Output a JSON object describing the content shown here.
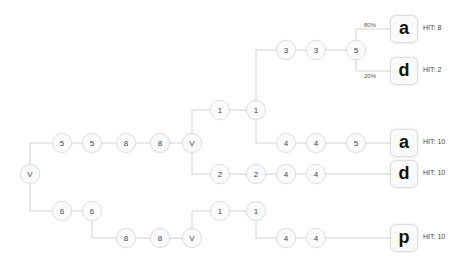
{
  "colors": {
    "edge": "#d2d2d2",
    "node_border": "#e0e0e0",
    "text": "#444444"
  },
  "nodes": [
    {
      "id": "n0",
      "label": "V",
      "x": 30,
      "y": 174
    },
    {
      "id": "n1",
      "label": "5",
      "x": 62,
      "y": 143
    },
    {
      "id": "n2",
      "label": "5",
      "x": 92,
      "y": 143
    },
    {
      "id": "n3",
      "label": "6",
      "x": 62,
      "y": 211
    },
    {
      "id": "n4",
      "label": "6",
      "x": 92,
      "y": 211
    },
    {
      "id": "n5",
      "label": "8",
      "x": 126,
      "y": 143
    },
    {
      "id": "n6",
      "label": "8",
      "x": 160,
      "y": 143
    },
    {
      "id": "n7",
      "label": "V",
      "x": 192,
      "y": 143
    },
    {
      "id": "n8",
      "label": "1",
      "x": 220,
      "y": 110
    },
    {
      "id": "n9",
      "label": "1",
      "x": 256,
      "y": 110
    },
    {
      "id": "n10",
      "label": "2",
      "x": 220,
      "y": 174
    },
    {
      "id": "n11",
      "label": "2",
      "x": 256,
      "y": 174
    },
    {
      "id": "n12",
      "label": "3",
      "x": 286,
      "y": 50
    },
    {
      "id": "n13",
      "label": "3",
      "x": 316,
      "y": 50
    },
    {
      "id": "n14",
      "label": "5",
      "x": 356,
      "y": 50
    },
    {
      "id": "n15",
      "label": "4",
      "x": 286,
      "y": 143
    },
    {
      "id": "n16",
      "label": "4",
      "x": 316,
      "y": 143
    },
    {
      "id": "n17",
      "label": "5",
      "x": 356,
      "y": 143
    },
    {
      "id": "n18",
      "label": "4",
      "x": 286,
      "y": 174
    },
    {
      "id": "n19",
      "label": "4",
      "x": 316,
      "y": 174
    },
    {
      "id": "n20",
      "label": "8",
      "x": 126,
      "y": 238
    },
    {
      "id": "n21",
      "label": "8",
      "x": 160,
      "y": 238
    },
    {
      "id": "n22",
      "label": "V",
      "x": 192,
      "y": 238
    },
    {
      "id": "n23",
      "label": "1",
      "x": 220,
      "y": 211
    },
    {
      "id": "n24",
      "label": "1",
      "x": 256,
      "y": 211
    },
    {
      "id": "n25",
      "label": "4",
      "x": 286,
      "y": 238
    },
    {
      "id": "n26",
      "label": "4",
      "x": 316,
      "y": 238
    }
  ],
  "leaves": [
    {
      "id": "l0",
      "label": "a",
      "x": 404,
      "y": 29,
      "hit": "HIT: 8"
    },
    {
      "id": "l1",
      "label": "d",
      "x": 404,
      "y": 71,
      "hit": "HIT: 2"
    },
    {
      "id": "l2",
      "label": "a",
      "x": 404,
      "y": 143,
      "hit": "HIT: 10"
    },
    {
      "id": "l3",
      "label": "d",
      "x": 404,
      "y": 174,
      "hit": "HIT: 10"
    },
    {
      "id": "l4",
      "label": "p",
      "x": 404,
      "y": 238,
      "hit": "HIT: 10"
    }
  ],
  "edges": [
    [
      "n0",
      "n1"
    ],
    [
      "n1",
      "n2"
    ],
    [
      "n0",
      "n3"
    ],
    [
      "n3",
      "n4"
    ],
    [
      "n2",
      "n5"
    ],
    [
      "n5",
      "n6"
    ],
    [
      "n6",
      "n7"
    ],
    [
      "n7",
      "n8"
    ],
    [
      "n8",
      "n9"
    ],
    [
      "n7",
      "n10"
    ],
    [
      "n10",
      "n11"
    ],
    [
      "n9",
      "n12"
    ],
    [
      "n12",
      "n13"
    ],
    [
      "n13",
      "n14"
    ],
    [
      "n9",
      "n15"
    ],
    [
      "n15",
      "n16"
    ],
    [
      "n16",
      "n17"
    ],
    [
      "n17",
      "l2"
    ],
    [
      "n11",
      "n18"
    ],
    [
      "n18",
      "n19"
    ],
    [
      "n19",
      "l3"
    ],
    [
      "n14",
      "l0"
    ],
    [
      "n14",
      "l1"
    ],
    [
      "n4",
      "n20"
    ],
    [
      "n20",
      "n21"
    ],
    [
      "n21",
      "n22"
    ],
    [
      "n22",
      "n23"
    ],
    [
      "n23",
      "n24"
    ],
    [
      "n24",
      "n25"
    ],
    [
      "n25",
      "n26"
    ],
    [
      "n26",
      "l4"
    ]
  ],
  "probabilities": [
    {
      "label": "80%",
      "x": 364,
      "y": 22
    },
    {
      "label": "20%",
      "x": 364,
      "y": 73
    }
  ]
}
